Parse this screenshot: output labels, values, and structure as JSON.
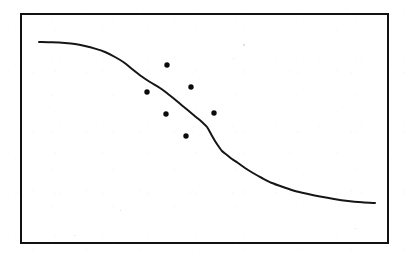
{
  "figure": {
    "title": "",
    "background_color": "#ffffff",
    "frame": {
      "x": 21,
      "y": 14,
      "width": 367,
      "height": 229,
      "stroke_color": "#111111",
      "stroke_width": 2.1
    },
    "canvas": {
      "width": 409,
      "height": 259
    }
  },
  "chart_data": {
    "type": "line",
    "title": "",
    "subtitle": "",
    "xlabel": "",
    "ylabel": "",
    "xlim": [
      21,
      388
    ],
    "ylim": [
      243,
      14
    ],
    "grid": false,
    "legend": "none",
    "axis_ticks": {
      "x": [],
      "y": []
    },
    "annotations": [],
    "series": [
      {
        "name": "fitted-sigmoid-curve",
        "type": "line",
        "color": "#151515",
        "line_width": 2.0,
        "points": [
          [
            39,
            42
          ],
          [
            52,
            42.3
          ],
          [
            65,
            43
          ],
          [
            75,
            44
          ],
          [
            85,
            46
          ],
          [
            95,
            48.6
          ],
          [
            105,
            52
          ],
          [
            115,
            57
          ],
          [
            124,
            62.5
          ],
          [
            132,
            69
          ],
          [
            141,
            76
          ],
          [
            150,
            82
          ],
          [
            160,
            88
          ],
          [
            168,
            94
          ],
          [
            175,
            99.5
          ],
          [
            182,
            105.5
          ],
          [
            190,
            112
          ],
          [
            196,
            117
          ],
          [
            202,
            122
          ],
          [
            207,
            127
          ],
          [
            211,
            134
          ],
          [
            215,
            141
          ],
          [
            219,
            147
          ],
          [
            222,
            151
          ],
          [
            227,
            155
          ],
          [
            232,
            159
          ],
          [
            238,
            163
          ],
          [
            245,
            168
          ],
          [
            253,
            173
          ],
          [
            262,
            178
          ],
          [
            272,
            183
          ],
          [
            283,
            187
          ],
          [
            295,
            191
          ],
          [
            308,
            194
          ],
          [
            320,
            196.5
          ],
          [
            334,
            199
          ],
          [
            348,
            201
          ],
          [
            362,
            202.3
          ],
          [
            375,
            203
          ]
        ]
      },
      {
        "name": "observed-data-points",
        "type": "scatter",
        "color": "#0b0b0b",
        "marker": "filled-circle",
        "marker_radius": 2.7,
        "points": [
          [
            167,
            65
          ],
          [
            147,
            92
          ],
          [
            191,
            87
          ],
          [
            166,
            114
          ],
          [
            214,
            113
          ],
          [
            186,
            136
          ]
        ]
      }
    ]
  },
  "specks": [
    {
      "x": 243,
      "y": 44,
      "size": 1.6
    },
    {
      "x": 74,
      "y": 235,
      "size": 1.3
    },
    {
      "x": 355,
      "y": 228,
      "size": 1.2
    },
    {
      "x": 120,
      "y": 210,
      "size": 1.1
    }
  ]
}
